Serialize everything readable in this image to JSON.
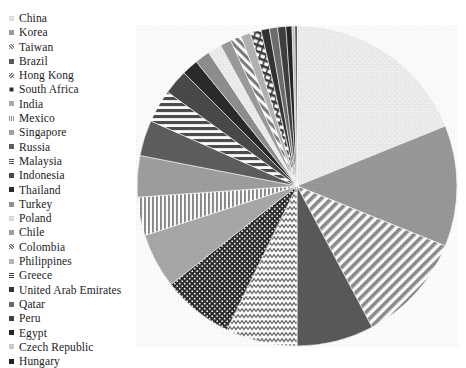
{
  "chart_data": {
    "type": "pie",
    "title": "",
    "subtitle": "",
    "xlabel": "",
    "ylabel": "",
    "legend_position": "left",
    "grid": false,
    "start_angle_deg": 0,
    "direction": "clockwise",
    "categories": [
      "China",
      "Korea",
      "Taiwan",
      "Brazil",
      "Hong Kong",
      "South Africa",
      "India",
      "Mexico",
      "Singapore",
      "Russia",
      "Malaysia",
      "Indonesia",
      "Thailand",
      "Turkey",
      "Poland",
      "Chile",
      "Colombia",
      "Philippines",
      "Greece",
      "United Arab Emirates",
      "Qatar",
      "Peru",
      "Egypt",
      "Czech Republic",
      "Hungary"
    ],
    "values": [
      20.0,
      12.0,
      11.0,
      8.0,
      7.5,
      7.0,
      6.0,
      5.0,
      4.5,
      4.0,
      3.5,
      3.0,
      2.2,
      1.8,
      1.5,
      1.2,
      1.0,
      0.8,
      0.6,
      0.5,
      0.4,
      0.3,
      0.2,
      0.1,
      0.05
    ],
    "units": "percent share"
  },
  "legend": {
    "items": [
      {
        "label": "China",
        "pattern": "light-dots",
        "color": "#e6e6e6"
      },
      {
        "label": "Korea",
        "pattern": "solid-medium",
        "color": "#9a9a9a"
      },
      {
        "label": "Taiwan",
        "pattern": "diagonal-stripes",
        "color": "#8d8d8d"
      },
      {
        "label": "Brazil",
        "pattern": "solid-dark",
        "color": "#575757"
      },
      {
        "label": "Hong Kong",
        "pattern": "zigzag",
        "color": "#777777"
      },
      {
        "label": "South Africa",
        "pattern": "dark-dots",
        "color": "#2e2e2e"
      },
      {
        "label": "India",
        "pattern": "solid-light-gray",
        "color": "#a9a9a9"
      },
      {
        "label": "Mexico",
        "pattern": "vertical-stripes",
        "color": "#8a8a8a"
      },
      {
        "label": "Singapore",
        "pattern": "solid-medium-2",
        "color": "#9f9f9f"
      },
      {
        "label": "Russia",
        "pattern": "solid-dark-2",
        "color": "#5e5e5e"
      },
      {
        "label": "Malaysia",
        "pattern": "horizontal-stripes",
        "color": "#4e4e4e"
      },
      {
        "label": "Indonesia",
        "pattern": "solid-dark-3",
        "color": "#4a4a4a"
      },
      {
        "label": "Thailand",
        "pattern": "solid-dark-4",
        "color": "#2b2b2b"
      },
      {
        "label": "Turkey",
        "pattern": "solid-mid-gray",
        "color": "#8f8f8f"
      },
      {
        "label": "Poland",
        "pattern": "light-dots-2",
        "color": "#dcdcdc"
      },
      {
        "label": "Chile",
        "pattern": "solid-gray-3",
        "color": "#9c9c9c"
      },
      {
        "label": "Colombia",
        "pattern": "diagonal-stripes-2",
        "color": "#7d7d7d"
      },
      {
        "label": "Philippines",
        "pattern": "solid-gray-4",
        "color": "#b4b4b4"
      },
      {
        "label": "Greece",
        "pattern": "ladder-dashes",
        "color": "#3c3c3c"
      },
      {
        "label": "United Arab Emirates",
        "pattern": "solid-dark-5",
        "color": "#333333"
      },
      {
        "label": "Qatar",
        "pattern": "solid-dark-6",
        "color": "#6a6a6a"
      },
      {
        "label": "Peru",
        "pattern": "solid-dark-7",
        "color": "#3f3f3f"
      },
      {
        "label": "Egypt",
        "pattern": "solid-dark-8",
        "color": "#262626"
      },
      {
        "label": "Czech Republic",
        "pattern": "light-gray",
        "color": "#c9c9c9"
      },
      {
        "label": "Hungary",
        "pattern": "solid-dark-9",
        "color": "#1f1f1f"
      }
    ]
  },
  "pie": {
    "center_x": 161,
    "center_y": 161,
    "radius": 160,
    "slices": [
      {
        "label": "China",
        "start": 0.0,
        "end": 68.0,
        "fill": "url(#p-dots-light)",
        "base": "#ededed"
      },
      {
        "label": "Korea",
        "start": 68.0,
        "end": 112.0,
        "fill": "none",
        "base": "#9a9a9a"
      },
      {
        "label": "Taiwan",
        "start": 112.0,
        "end": 152.0,
        "fill": "url(#p-diag)",
        "base": "#ffffff"
      },
      {
        "label": "Brazil",
        "start": 152.0,
        "end": 180.0,
        "fill": "none",
        "base": "#5a5a5a"
      },
      {
        "label": "Hong Kong",
        "start": 180.0,
        "end": 206.0,
        "fill": "url(#p-zig)",
        "base": "#ffffff"
      },
      {
        "label": "South Africa",
        "start": 206.0,
        "end": 232.0,
        "fill": "url(#p-dots-dark)",
        "base": "#2e2e2e"
      },
      {
        "label": "India",
        "start": 232.0,
        "end": 252.0,
        "fill": "none",
        "base": "#a9a9a9"
      },
      {
        "label": "Mexico",
        "start": 252.0,
        "end": 266.0,
        "fill": "url(#p-vert)",
        "base": "#ffffff"
      },
      {
        "label": "Singapore",
        "start": 266.0,
        "end": 281.0,
        "fill": "none",
        "base": "#9f9f9f"
      },
      {
        "label": "Russia",
        "start": 281.0,
        "end": 294.0,
        "fill": "none",
        "base": "#5e5e5e"
      },
      {
        "label": "Malaysia",
        "start": 294.0,
        "end": 306.0,
        "fill": "url(#p-horiz)",
        "base": "#ffffff"
      },
      {
        "label": "Indonesia",
        "start": 306.0,
        "end": 315.0,
        "fill": "none",
        "base": "#4a4a4a"
      },
      {
        "label": "Thailand",
        "start": 315.0,
        "end": 321.0,
        "fill": "none",
        "base": "#2b2b2b"
      },
      {
        "label": "Turkey",
        "start": 321.0,
        "end": 326.5,
        "fill": "none",
        "base": "#8f8f8f"
      },
      {
        "label": "Poland",
        "start": 326.5,
        "end": 331.5,
        "fill": "url(#p-dots-light)",
        "base": "#e2e2e2"
      },
      {
        "label": "Chile",
        "start": 331.5,
        "end": 335.5,
        "fill": "none",
        "base": "#9c9c9c"
      },
      {
        "label": "Colombia",
        "start": 335.5,
        "end": 339.5,
        "fill": "url(#p-diag2)",
        "base": "#ffffff"
      },
      {
        "label": "Philippines",
        "start": 339.5,
        "end": 343.0,
        "fill": "none",
        "base": "#b4b4b4"
      },
      {
        "label": "Greece",
        "start": 343.0,
        "end": 347.0,
        "fill": "url(#p-ladder)",
        "base": "#ffffff"
      },
      {
        "label": "United Arab Emirates",
        "start": 347.0,
        "end": 350.0,
        "fill": "none",
        "base": "#333333"
      },
      {
        "label": "Qatar",
        "start": 350.0,
        "end": 353.0,
        "fill": "none",
        "base": "#6e6e6e"
      },
      {
        "label": "Peru",
        "start": 353.0,
        "end": 356.0,
        "fill": "none",
        "base": "#3f3f3f"
      },
      {
        "label": "Egypt",
        "start": 356.0,
        "end": 358.2,
        "fill": "none",
        "base": "#262626"
      },
      {
        "label": "Czech Republic",
        "start": 358.2,
        "end": 359.3,
        "fill": "none",
        "base": "#c4c4c4"
      },
      {
        "label": "Hungary",
        "start": 359.3,
        "end": 360.0,
        "fill": "none",
        "base": "#1f1f1f"
      }
    ]
  }
}
